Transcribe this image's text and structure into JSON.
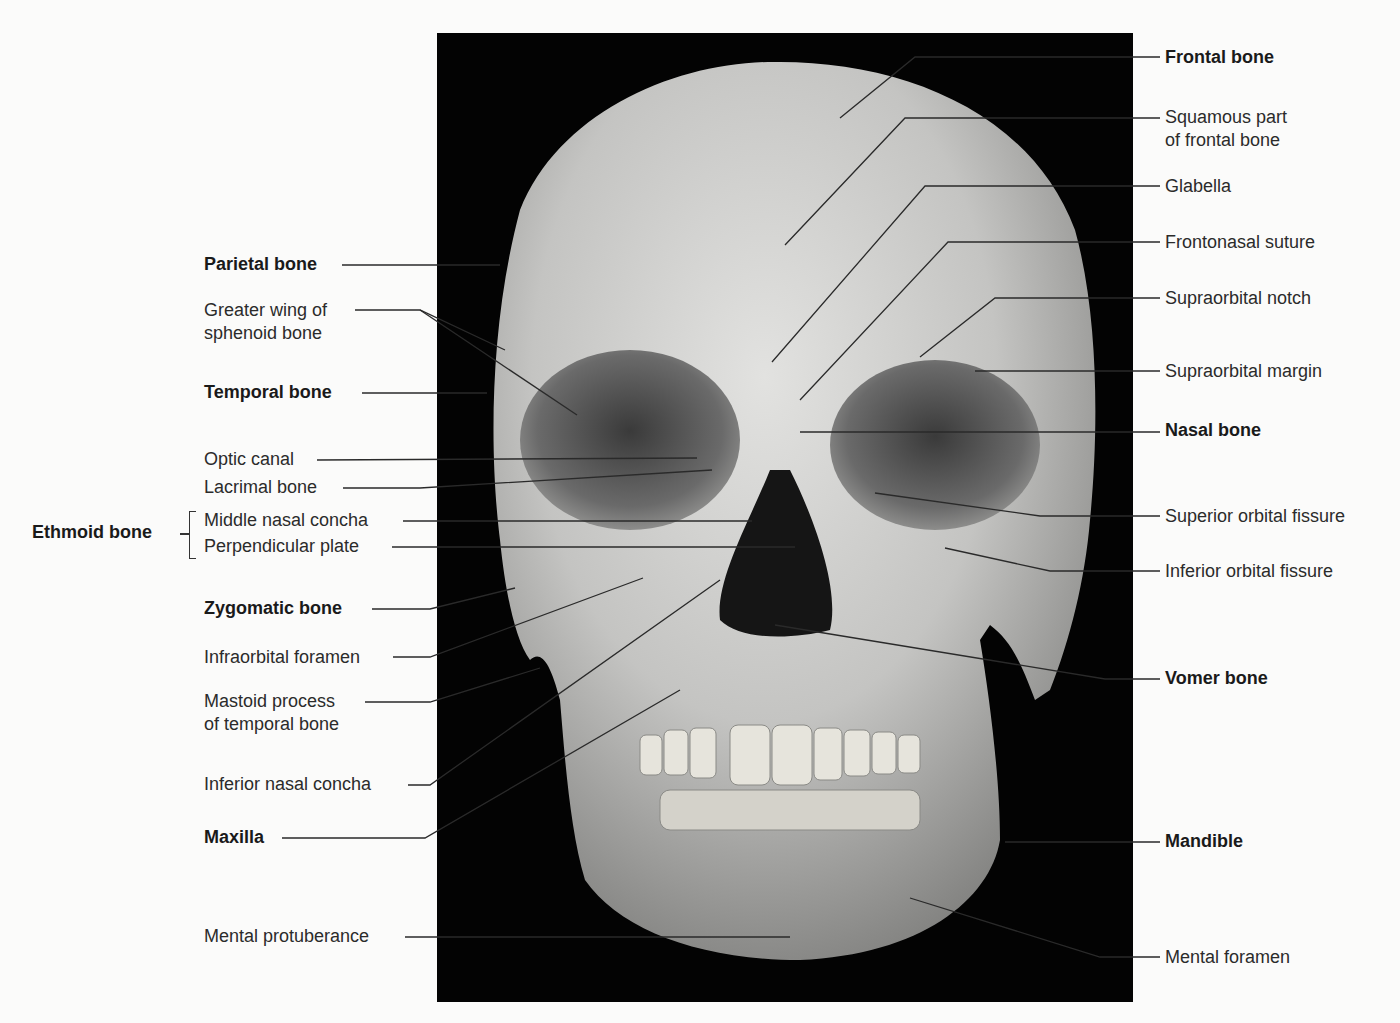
{
  "figure": {
    "photo_background": "#030303",
    "bone_color": "#bdbdbd"
  },
  "labels_left": [
    {
      "id": "parietal",
      "text": "Parietal bone",
      "bold": true
    },
    {
      "id": "greater-wing",
      "text": "Greater wing of\nsphenoid bone",
      "line1": "Greater wing of",
      "line2": "sphenoid bone",
      "bold": false
    },
    {
      "id": "temporal",
      "text": "Temporal bone",
      "bold": true
    },
    {
      "id": "optic-canal",
      "text": "Optic canal",
      "bold": false
    },
    {
      "id": "lacrimal",
      "text": "Lacrimal bone",
      "bold": false
    },
    {
      "id": "middle-nasal-concha",
      "text": "Middle nasal concha",
      "bold": false
    },
    {
      "id": "perpendicular-plate",
      "text": "Perpendicular plate",
      "bold": false
    },
    {
      "id": "zygomatic",
      "text": "Zygomatic bone",
      "bold": true
    },
    {
      "id": "infraorbital-foramen",
      "text": "Infraorbital foramen",
      "bold": false
    },
    {
      "id": "mastoid",
      "text": "Mastoid process\nof temporal bone",
      "line1": "Mastoid process",
      "line2": "of temporal bone",
      "bold": false
    },
    {
      "id": "inferior-nasal-concha",
      "text": "Inferior nasal concha",
      "bold": false
    },
    {
      "id": "maxilla",
      "text": "Maxilla",
      "bold": true
    },
    {
      "id": "mental-protuberance",
      "text": "Mental protuberance",
      "bold": false
    }
  ],
  "group_label": {
    "text": "Ethmoid bone",
    "bold": true,
    "members": [
      "Middle nasal concha",
      "Perpendicular plate"
    ]
  },
  "labels_right": [
    {
      "id": "frontal",
      "text": "Frontal bone",
      "bold": true
    },
    {
      "id": "squamous",
      "text": "Squamous part\nof frontal bone",
      "line1": "Squamous part",
      "line2": "of frontal bone",
      "bold": false
    },
    {
      "id": "glabella",
      "text": "Glabella",
      "bold": false
    },
    {
      "id": "frontonasal",
      "text": "Frontonasal suture",
      "bold": false
    },
    {
      "id": "supraorbital-notch",
      "text": "Supraorbital notch",
      "bold": false
    },
    {
      "id": "supraorbital-margin",
      "text": "Supraorbital margin",
      "bold": false
    },
    {
      "id": "nasal",
      "text": "Nasal bone",
      "bold": true
    },
    {
      "id": "superior-orbital-fissure",
      "text": "Superior orbital fissure",
      "bold": false
    },
    {
      "id": "inferior-orbital-fissure",
      "text": "Inferior orbital fissure",
      "bold": false
    },
    {
      "id": "vomer",
      "text": "Vomer bone",
      "bold": true
    },
    {
      "id": "mandible",
      "text": "Mandible",
      "bold": true
    },
    {
      "id": "mental-foramen",
      "text": "Mental foramen",
      "bold": false
    }
  ]
}
